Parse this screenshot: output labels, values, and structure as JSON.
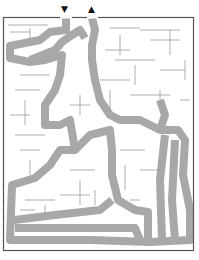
{
  "maze": {
    "title": "Maze puzzle",
    "entrance": {
      "icon": "arrow-down-icon",
      "glyph": "▼",
      "x": 66,
      "y": 12
    },
    "exit": {
      "icon": "arrow-up-icon",
      "glyph": "▲",
      "x": 93,
      "y": 12
    },
    "colors": {
      "border": "#555555",
      "walls": "#9a9a9a",
      "path": "#a8a8a8",
      "background": "#ffffff"
    }
  }
}
